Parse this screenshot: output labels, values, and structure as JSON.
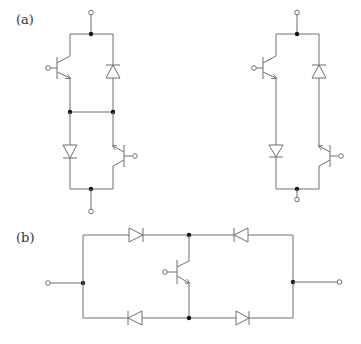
{
  "figure": {
    "labels": {
      "a": "(a)",
      "b": "(b)"
    },
    "colors": {
      "wire": "#6e6e6e",
      "junction": "#111111",
      "background": "#ffffff",
      "label": "#333333"
    },
    "circuit_a_left": {
      "description": "Bidirectional switch: two transistor-diode pairs in series with a middle cross-link",
      "components": [
        "transistor-top-left",
        "diode-top-right-up",
        "diode-bottom-left-down",
        "transistor-bottom-right"
      ],
      "middle_link": true
    },
    "circuit_a_right": {
      "description": "Same topology without middle cross-link",
      "components": [
        "transistor-top-left",
        "diode-top-right-up",
        "diode-bottom-left-down",
        "transistor-bottom-right"
      ],
      "middle_link": false
    },
    "circuit_b": {
      "description": "Diode bridge with single transistor in center branch",
      "components": [
        "diode-top-left-right",
        "diode-top-right-left",
        "diode-bottom-left-left",
        "diode-bottom-right-right",
        "transistor-center"
      ]
    }
  }
}
